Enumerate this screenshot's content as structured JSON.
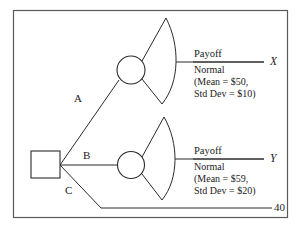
{
  "diagram": {
    "type": "decision-tree",
    "title": "",
    "decision_node": {
      "name": "decision-node",
      "shape": "square"
    },
    "branches": [
      {
        "id": "A",
        "label": "A",
        "leads_to": "chance-node-upper"
      },
      {
        "id": "B",
        "label": "B",
        "leads_to": "chance-node-lower"
      },
      {
        "id": "C",
        "label": "C",
        "leads_to": "terminal-40"
      }
    ],
    "chance_nodes": [
      {
        "id": "chance-node-upper",
        "shape": "circle"
      },
      {
        "id": "chance-node-lower",
        "shape": "circle"
      }
    ],
    "outcomes": [
      {
        "id": "outcome-x",
        "variable": "X",
        "payoff_title": "Payoff",
        "distribution": "Normal",
        "parameters_line1": "(Mean = $50,",
        "parameters_line2": "Std Dev = $10)",
        "mean": "$50",
        "std_dev": "$10"
      },
      {
        "id": "outcome-y",
        "variable": "Y",
        "payoff_title": "Payoff",
        "distribution": "Normal",
        "parameters_line1": "(Mean = $59,",
        "parameters_line2": "Std Dev = $20)",
        "mean": "$59",
        "std_dev": "$20"
      }
    ],
    "terminal": {
      "id": "terminal-40",
      "value": "40"
    },
    "colors": {
      "line": "#2b2b2b",
      "frame": "#5a5a5a",
      "text": "#1b1b1b",
      "background": "#ffffff"
    }
  }
}
